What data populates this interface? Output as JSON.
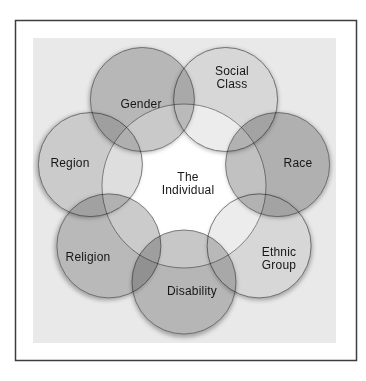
{
  "figure": {
    "center_label": {
      "lines": [
        "The",
        "Individual"
      ]
    },
    "circles": [
      {
        "id": "gender",
        "label_lines": [
          "Gender"
        ],
        "fill": "#c9c9c9"
      },
      {
        "id": "social-class",
        "label_lines": [
          "Social",
          "Class"
        ],
        "fill": "#ececec"
      },
      {
        "id": "race",
        "label_lines": [
          "Race"
        ],
        "fill": "#c1c1c1"
      },
      {
        "id": "ethnic-group",
        "label_lines": [
          "Ethnic",
          "Group"
        ],
        "fill": "#ececec"
      },
      {
        "id": "disability",
        "label_lines": [
          "Disability"
        ],
        "fill": "#c7c7c7"
      },
      {
        "id": "religion",
        "label_lines": [
          "Religion"
        ],
        "fill": "#cbcbcb"
      },
      {
        "id": "region",
        "label_lines": [
          "Region"
        ],
        "fill": "#dedede"
      }
    ],
    "colors": {
      "page": "#ffffff",
      "panel": "#e9e9e9",
      "border": "#3d3d3d",
      "circle_stroke": "#7a7a7a",
      "inner_circle_fill": "#ffffff",
      "inner_circle_stroke": "#8f8f8f",
      "text": "#161616"
    }
  }
}
